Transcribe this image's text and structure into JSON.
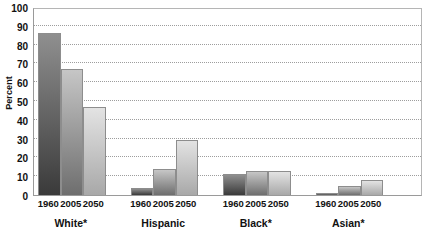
{
  "chart_data": {
    "type": "bar",
    "title": "",
    "xlabel": "",
    "ylabel": "Percent",
    "ylim": [
      0,
      100
    ],
    "ytick_step": 10,
    "yticks": [
      100,
      90,
      80,
      70,
      60,
      50,
      40,
      30,
      20,
      10,
      0
    ],
    "grid": true,
    "legend": "none",
    "categories": [
      "1960",
      "2005",
      "2050"
    ],
    "groups": [
      {
        "name": "White*",
        "bars": [
          {
            "category": "1960",
            "value": 86
          },
          {
            "category": "2005",
            "value": 67
          },
          {
            "category": "2050",
            "value": 47
          }
        ]
      },
      {
        "name": "Hispanic",
        "bars": [
          {
            "category": "1960",
            "value": 3.5
          },
          {
            "category": "2005",
            "value": 14
          },
          {
            "category": "2050",
            "value": 29
          }
        ]
      },
      {
        "name": "Black*",
        "bars": [
          {
            "category": "1960",
            "value": 11
          },
          {
            "category": "2005",
            "value": 13
          },
          {
            "category": "2050",
            "value": 13
          }
        ]
      },
      {
        "name": "Asian*",
        "bars": [
          {
            "category": "1960",
            "value": 1
          },
          {
            "category": "2005",
            "value": 5
          },
          {
            "category": "2050",
            "value": 8
          }
        ]
      }
    ],
    "colors": {
      "bar_1960_top": "#8f8f8f",
      "bar_1960_bottom": "#3a3a3a",
      "bar_2005_top": "#c6c6c6",
      "bar_2005_bottom": "#6e6e6e",
      "bar_2050_top": "#e3e3e3",
      "bar_2050_bottom": "#a8a8a8",
      "grid": "#9d9d9d",
      "axis": "#9a9a9a",
      "text": "#111111",
      "background": "#ffffff"
    }
  }
}
